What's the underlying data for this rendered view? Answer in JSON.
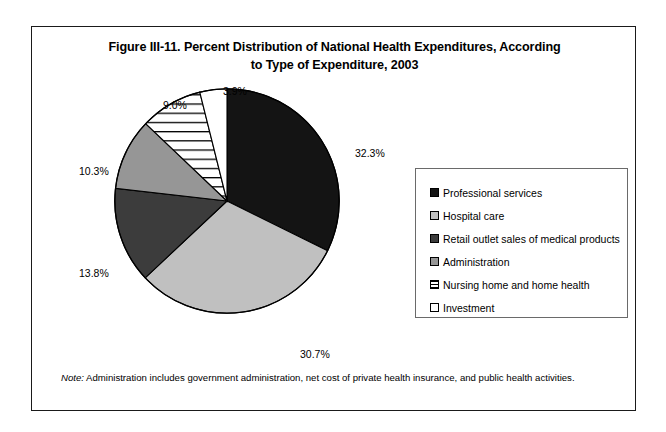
{
  "figure": {
    "title": "Figure III-11. Percent Distribution of National Health Expenditures, According to Type of Expenditure, 2003",
    "title_line1": "Figure III-11. Percent Distribution of National Health Expenditures, According",
    "title_line2": "to Type of Expenditure, 2003",
    "note_word": "Note:",
    "note_text": "Administration includes government administration, net cost of private health insurance, and public health activities."
  },
  "chart_data": {
    "type": "pie",
    "title": "Figure III-11. Percent Distribution of National Health Expenditures, According to Type of Expenditure, 2003",
    "xlabel": "",
    "ylabel": "",
    "units": "percent",
    "legend_position": "right",
    "start_angle_deg": 0,
    "direction": "clockwise",
    "categories": [
      "Professional services",
      "Hospital care",
      "Retail outlet sales of medical products",
      "Administration",
      "Nursing home and home health",
      "Investment"
    ],
    "values": [
      32.3,
      30.7,
      13.8,
      10.3,
      9.0,
      3.9
    ],
    "labels": [
      "32.3%",
      "30.7%",
      "13.8%",
      "10.3%",
      "9.0%",
      "3.9%"
    ],
    "slices": [
      {
        "name": "Professional services",
        "value": 32.3,
        "label": "32.3%",
        "fill": "#141414",
        "pattern": "solid"
      },
      {
        "name": "Hospital care",
        "value": 30.7,
        "label": "30.7%",
        "fill": "#c0c0c0",
        "pattern": "solid"
      },
      {
        "name": "Retail outlet sales of medical products",
        "value": 13.8,
        "label": "13.8%",
        "fill": "#3c3c3c",
        "pattern": "solid"
      },
      {
        "name": "Administration",
        "value": 10.3,
        "label": "10.3%",
        "fill": "#969696",
        "pattern": "solid"
      },
      {
        "name": "Nursing home and home health",
        "value": 9.0,
        "label": "9.0%",
        "fill": "#ffffff",
        "pattern": "horizontal-stripes"
      },
      {
        "name": "Investment",
        "value": 3.9,
        "label": "3.9%",
        "fill": "#ffffff",
        "pattern": "solid"
      }
    ],
    "total": 100.0
  },
  "legend": {
    "items": [
      {
        "label": "Professional services",
        "swatch": "#141414",
        "pattern": "solid"
      },
      {
        "label": "Hospital care",
        "swatch": "#c0c0c0",
        "pattern": "solid"
      },
      {
        "label": "Retail outlet sales of medical products",
        "swatch": "#3c3c3c",
        "pattern": "solid"
      },
      {
        "label": "Administration",
        "swatch": "#969696",
        "pattern": "solid"
      },
      {
        "label": "Nursing home and home health",
        "swatch": "#ffffff",
        "pattern": "horizontal-stripes"
      },
      {
        "label": "Investment",
        "swatch": "#ffffff",
        "pattern": "solid"
      }
    ]
  }
}
